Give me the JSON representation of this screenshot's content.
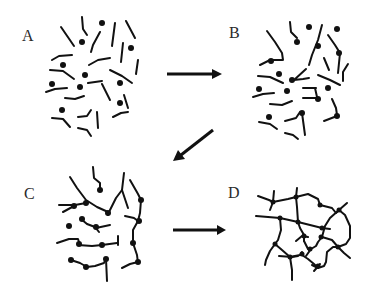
{
  "figure": {
    "panels": [
      {
        "id": "A",
        "label": "A",
        "description": "Separate polymer chains with reactive end groups"
      },
      {
        "id": "B",
        "label": "B",
        "description": "Chains beginning to link at reactive sites"
      },
      {
        "id": "C",
        "label": "C",
        "description": "Branched chains with multiple junctions"
      },
      {
        "id": "D",
        "label": "D",
        "description": "Fully crosslinked network"
      }
    ],
    "arrows": [
      {
        "from": "A",
        "to": "B",
        "direction": "right"
      },
      {
        "from": "B",
        "to": "C",
        "direction": "down-left"
      },
      {
        "from": "C",
        "to": "D",
        "direction": "right"
      }
    ],
    "colors": {
      "ink": "#111111",
      "label": "#2a2a2a",
      "background": "#ffffff"
    }
  }
}
